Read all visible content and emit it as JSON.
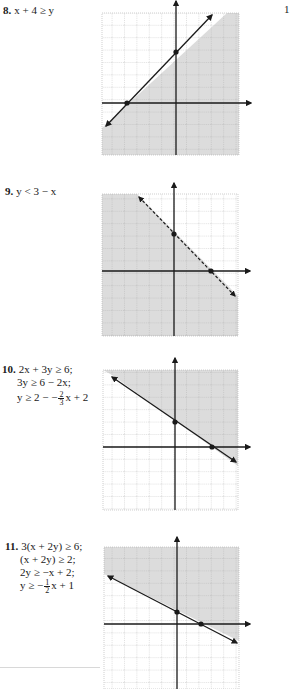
{
  "column_marker": "1",
  "problems": [
    {
      "number": "8.",
      "lines": [
        "x + 4 ≥ y"
      ],
      "graph": {
        "boundary": "y = x + 4",
        "line_style": "solid",
        "shade": "below",
        "points": [
          [
            -4,
            0
          ],
          [
            0,
            4
          ]
        ]
      }
    },
    {
      "number": "9.",
      "lines": [
        "y < 3 − x"
      ],
      "graph": {
        "boundary": "y = 3 − x",
        "line_style": "dashed",
        "shade": "below",
        "points": [
          [
            0,
            3
          ],
          [
            3,
            0
          ]
        ]
      }
    },
    {
      "number": "10.",
      "lines": [
        "2x + 3y ≥ 6;",
        "3y ≥ 6 − 2x;"
      ],
      "last_line": {
        "pre": "y ≥ 2 − −",
        "num": "2",
        "den": "3",
        "post": "x + 2"
      },
      "graph": {
        "boundary": "y = −(2/3)x + 2",
        "line_style": "solid",
        "shade": "above",
        "points": [
          [
            0,
            2
          ],
          [
            3,
            0
          ]
        ]
      }
    },
    {
      "number": "11.",
      "lines": [
        "3(x + 2y) ≥ 6;",
        "(x + 2y) ≥ 2;",
        "2y ≥ −x + 2;"
      ],
      "last_line": {
        "pre": "y ≥ −",
        "num": "1",
        "den": "2",
        "post": "x + 1"
      },
      "graph": {
        "boundary": "y = −(1/2)x + 1",
        "line_style": "solid",
        "shade": "above",
        "points": [
          [
            0,
            1
          ],
          [
            2,
            0
          ]
        ]
      }
    }
  ],
  "colors": {
    "shade": "#dcdcdc",
    "grid": "#9a9a9a",
    "axis": "#1a1a1a",
    "line": "#1a1a1a"
  }
}
